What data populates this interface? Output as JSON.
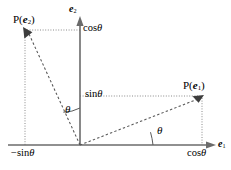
{
  "figure": {
    "type": "vector-rotation-diagram",
    "colors": {
      "axis": "#6b6b6b",
      "vector": "#555555",
      "projection": "#8a8a8a",
      "text": "#000000",
      "background": "#ffffff"
    }
  },
  "axes": {
    "horizontal": {
      "label_base": "e",
      "label_sub": "1",
      "origin_px": [
        80,
        145
      ],
      "end_px": [
        215,
        145
      ]
    },
    "vertical": {
      "label_base": "e",
      "label_sub": "2",
      "origin_px": [
        80,
        145
      ],
      "end_px": [
        80,
        18
      ]
    }
  },
  "points": [
    {
      "name": "P(e1)",
      "label_prefix": "P(",
      "label_base": "e",
      "label_sub": "1",
      "label_suffix": ")",
      "position_px": [
        202,
        96
      ],
      "x_value_label": "cos",
      "x_value_symbol": "θ",
      "y_value_label": "sin",
      "y_value_symbol": "θ"
    },
    {
      "name": "P(e2)",
      "label_prefix": "P(",
      "label_base": "e",
      "label_sub": "2",
      "label_suffix": ")",
      "position_px": [
        25,
        30
      ],
      "x_value_label": "−sin",
      "x_value_symbol": "θ",
      "y_value_label": "cos",
      "y_value_symbol": "θ"
    }
  ],
  "angles": [
    {
      "name": "theta-from-x-axis",
      "symbol": "θ",
      "between": [
        "e1-axis",
        "P(e1)-vector"
      ],
      "label_px": [
        159,
        131
      ]
    },
    {
      "name": "theta-from-y-axis",
      "symbol": "θ",
      "between": [
        "e2-axis",
        "P(e2)-vector"
      ],
      "label_px": [
        68,
        110
      ]
    }
  ],
  "tick_labels": {
    "cos_top": "cos",
    "sin_mid": "sin",
    "neg_sin_left": "−sin",
    "cos_right": "cos",
    "theta_symbol": "θ"
  }
}
